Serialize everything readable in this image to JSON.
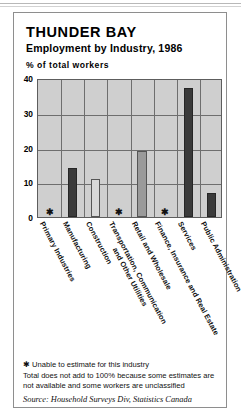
{
  "chart_title": "THUNDER BAY",
  "chart_subtitle": "Employment by Industry, 1986",
  "axis_unit_label": "% of total workers",
  "footnotes": {
    "asterisk": "✱ Unable to estimate for this industry",
    "total": "Total does not add to 100% because some estimates are not available and some workers are unclassified",
    "source": "Source: Household Surveys Div, Statistics Canada"
  },
  "chart_data": {
    "type": "bar",
    "xlabel": "",
    "ylabel": "% of total workers",
    "ylim": [
      0,
      40
    ],
    "yticks": [
      0,
      10,
      20,
      30,
      40
    ],
    "grid": true,
    "legend": "none",
    "categories": [
      "Primary Industries",
      "Manufacturing",
      "Construction",
      "Transportation, Communication and Other Utilities",
      "Retail and Wholesale",
      "Finance, Insurance and Real Estate",
      "Services",
      "Public Administration"
    ],
    "category_lines": [
      [
        "Primary Industries"
      ],
      [
        "Manufacturing"
      ],
      [
        "Construction"
      ],
      [
        "Transportation, Communication",
        "and Other Utilities"
      ],
      [
        "Retail and Wholesale"
      ],
      [
        "Finance, Insurance and Real Estate"
      ],
      [
        "Services"
      ],
      [
        "Public Administration"
      ]
    ],
    "values": [
      null,
      14,
      11,
      null,
      19,
      null,
      37,
      7
    ],
    "shades": [
      "none",
      "dark",
      "light",
      "none",
      "medium",
      "none",
      "dark",
      "dark"
    ],
    "unavailable_marker": "✱",
    "unavailable_categories": [
      "Primary Industries",
      "Construction",
      "Finance, Insurance and Real Estate"
    ],
    "note": "Asterisk marks industries where the value could not be estimated"
  },
  "colors": {
    "plot_background": "#cfcfcf",
    "grid": "#6e6e6e",
    "bar_dark": "#3a3a3a",
    "bar_medium": "#9a9a9a",
    "bar_light": "#d8d8d8",
    "frame": "#8e8e8e"
  }
}
